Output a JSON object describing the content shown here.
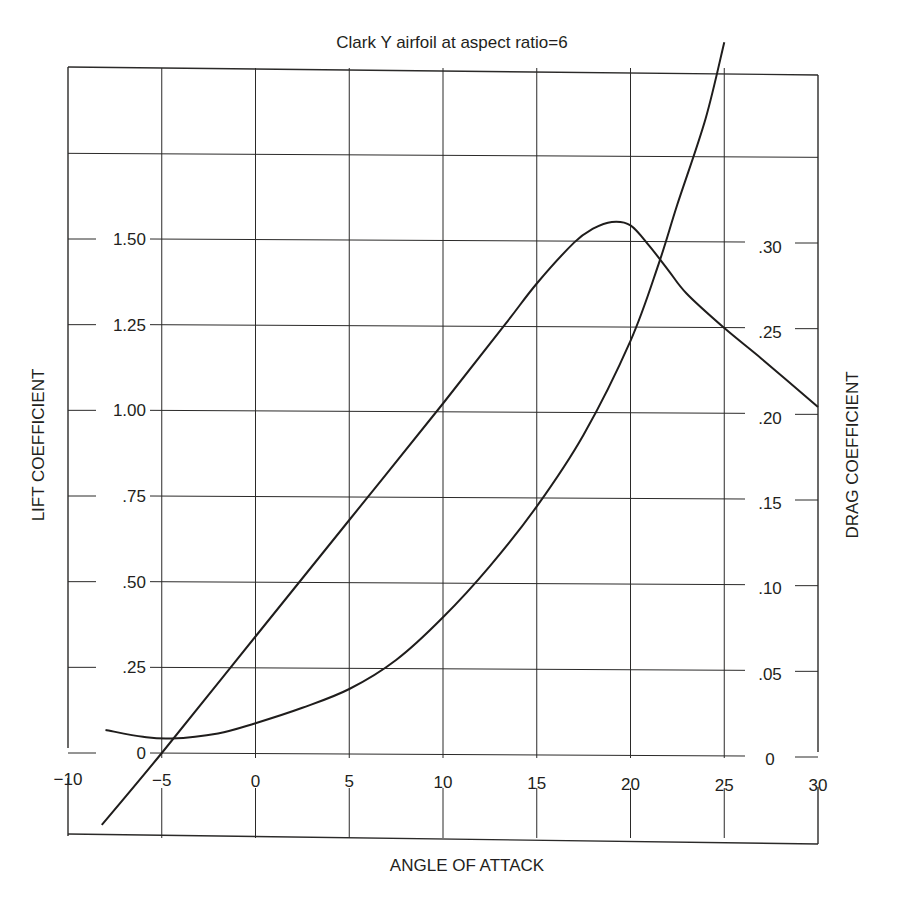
{
  "chart_data": {
    "type": "line",
    "title": "Clark Y airfoil at aspect ratio=6",
    "xlabel": "ANGLE OF ATTACK",
    "ylabel_left": "LIFT COEFFICIENT",
    "ylabel_right": "DRAG COEFFICIENT",
    "xlim": [
      -10,
      30
    ],
    "ylim_left": [
      -0.25,
      2.0
    ],
    "ylim_right": [
      -0.05,
      0.4
    ],
    "grid": true,
    "legend": "none",
    "x_ticks": [
      "-10",
      "-5",
      "0",
      "5",
      "10",
      "15",
      "20",
      "25",
      "30"
    ],
    "x_tick_values": [
      -10,
      -5,
      0,
      5,
      10,
      15,
      20,
      25,
      30
    ],
    "y_left_ticks": [
      "0",
      ".25",
      ".50",
      ".75",
      "1.00",
      "1.25",
      "1.50"
    ],
    "y_left_tick_values": [
      0,
      0.25,
      0.5,
      0.75,
      1.0,
      1.25,
      1.5
    ],
    "y_right_ticks": [
      "0",
      ".05",
      ".10",
      ".15",
      ".20",
      ".25",
      ".30"
    ],
    "y_right_tick_values": [
      0,
      0.05,
      0.1,
      0.15,
      0.2,
      0.25,
      0.3
    ],
    "series": [
      {
        "name": "Lift coefficient",
        "axis": "left",
        "x": [
          -8.2,
          -5,
          0,
          5,
          10,
          13.3,
          15,
          17,
          18,
          19,
          20,
          21,
          22,
          23,
          25,
          27,
          30
        ],
        "y": [
          -0.21,
          0.0,
          0.34,
          0.68,
          1.02,
          1.25,
          1.37,
          1.49,
          1.53,
          1.55,
          1.54,
          1.48,
          1.41,
          1.34,
          1.24,
          1.15,
          1.01
        ]
      },
      {
        "name": "Drag coefficient",
        "axis": "right",
        "x": [
          -8.0,
          -6,
          -4.5,
          -2,
          0,
          2.5,
          5,
          7.5,
          10,
          12.5,
          15,
          17.5,
          20,
          21.5,
          22.5,
          24,
          25
        ],
        "y": [
          0.017,
          0.013,
          0.012,
          0.015,
          0.021,
          0.03,
          0.041,
          0.058,
          0.083,
          0.113,
          0.148,
          0.19,
          0.245,
          0.29,
          0.325,
          0.375,
          0.42
        ]
      }
    ]
  },
  "labels": {
    "title": "Clark Y airfoil at aspect ratio=6",
    "xlabel": "ANGLE OF ATTACK",
    "ylabel_left": "LIFT COEFFICIENT",
    "ylabel_right": "DRAG COEFFICIENT"
  }
}
